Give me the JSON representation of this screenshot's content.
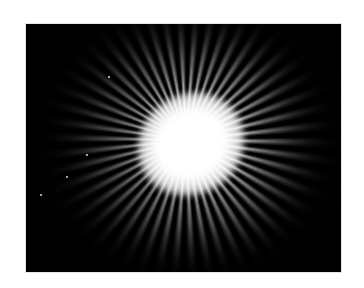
{
  "image": {
    "subject": "radial starburst pattern of textured ridges around a bright white center",
    "background_color": "#ffffff",
    "photo_bg_color": "#000000",
    "highlight_color": "#ffffff",
    "ray_color": "#a0a0a0",
    "frame": {
      "x": 26,
      "y": 24,
      "width": 315,
      "height": 248
    },
    "bright_center": {
      "x": 185,
      "y": 140
    }
  }
}
